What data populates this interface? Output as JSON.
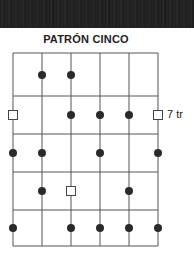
{
  "header": {
    "title": "PATRÓN CINCO"
  },
  "fret_label": "7 tr",
  "grid": {
    "strings": 6,
    "frets": 5,
    "x": [
      13,
      42,
      71,
      100,
      129,
      158
    ],
    "y": [
      53,
      96,
      134,
      172,
      210,
      246
    ],
    "line_color": "#555555"
  },
  "dots": [
    {
      "string": 2,
      "y": 75
    },
    {
      "string": 3,
      "y": 75
    },
    {
      "string": 3,
      "y": 115
    },
    {
      "string": 4,
      "y": 115
    },
    {
      "string": 5,
      "y": 115
    },
    {
      "string": 1,
      "y": 153
    },
    {
      "string": 2,
      "y": 153
    },
    {
      "string": 4,
      "y": 153
    },
    {
      "string": 6,
      "y": 153
    },
    {
      "string": 2,
      "y": 191
    },
    {
      "string": 5,
      "y": 191
    },
    {
      "string": 1,
      "y": 228
    },
    {
      "string": 3,
      "y": 228
    },
    {
      "string": 4,
      "y": 228
    },
    {
      "string": 5,
      "y": 228
    },
    {
      "string": 6,
      "y": 228
    }
  ],
  "root_squares": [
    {
      "string": 1,
      "y": 115
    },
    {
      "string": 6,
      "y": 115
    },
    {
      "string": 3,
      "y": 191
    }
  ],
  "colors": {
    "dot": "#2a2a2a",
    "line": "#555555",
    "bar": "#222222"
  }
}
